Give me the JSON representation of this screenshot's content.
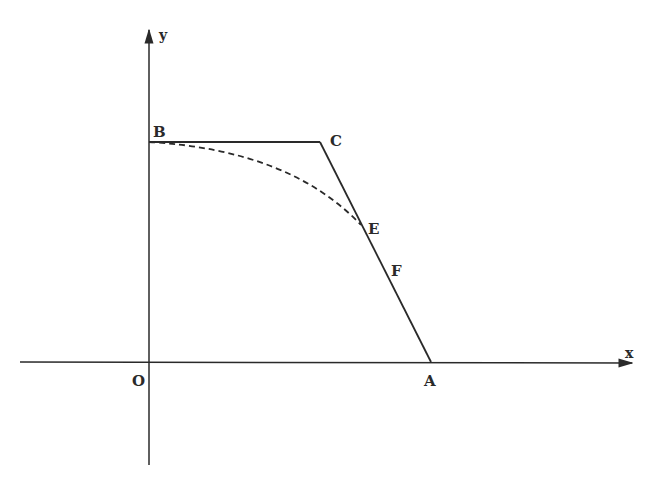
{
  "diagram": {
    "axes": {
      "x_label": "x",
      "y_label": "y",
      "origin_label": "O"
    },
    "points": [
      {
        "id": "B",
        "label": "B"
      },
      {
        "id": "C",
        "label": "C"
      },
      {
        "id": "E",
        "label": "E"
      },
      {
        "id": "F",
        "label": "F"
      },
      {
        "id": "A",
        "label": "A"
      }
    ],
    "segments": [
      {
        "from": "B",
        "to": "C",
        "style": "solid"
      },
      {
        "from": "C",
        "to": "A",
        "style": "solid",
        "passes_through": [
          "E",
          "F"
        ]
      }
    ],
    "curves": [
      {
        "from": "B",
        "to": "E",
        "style": "dashed",
        "shape": "concave-down arc"
      }
    ]
  }
}
